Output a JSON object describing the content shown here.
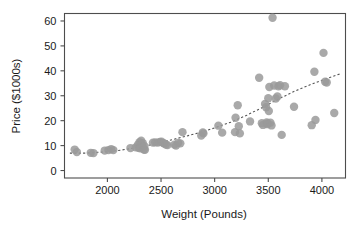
{
  "chart_data": {
    "type": "scatter",
    "title": "",
    "xlabel": "Weight (Pounds)",
    "ylabel": "Price ($1000s)",
    "xlim": [
      1600,
      4220
    ],
    "ylim": [
      -3,
      63
    ],
    "xticks": [
      2000,
      2500,
      3000,
      3500,
      4000
    ],
    "yticks": [
      0,
      10,
      20,
      30,
      40,
      50,
      60
    ],
    "xtick_labels": [
      "2000",
      "2500",
      "3000",
      "3500",
      "4000"
    ],
    "ytick_labels": [
      "0",
      "10",
      "20",
      "30",
      "40",
      "50",
      "60"
    ],
    "grid": false,
    "legend": false,
    "marker_color": "#9a9a9a",
    "marker_size": 4.2,
    "trend_style": "dashed",
    "trend_color": "#555555",
    "points": [
      [
        1695,
        8.4
      ],
      [
        1715,
        7.4
      ],
      [
        1845,
        7.1
      ],
      [
        1870,
        7.0
      ],
      [
        1975,
        8.0
      ],
      [
        2010,
        8.2
      ],
      [
        2035,
        8.6
      ],
      [
        2055,
        8.2
      ],
      [
        2215,
        9.0
      ],
      [
        2265,
        9.3
      ],
      [
        2285,
        10.4
      ],
      [
        2290,
        9.1
      ],
      [
        2300,
        11.4
      ],
      [
        2305,
        8.9
      ],
      [
        2315,
        12.0
      ],
      [
        2320,
        10.3
      ],
      [
        2325,
        9.4
      ],
      [
        2330,
        11.0
      ],
      [
        2340,
        8.4
      ],
      [
        2345,
        9.8
      ],
      [
        2350,
        8.3
      ],
      [
        2425,
        11.2
      ],
      [
        2445,
        11.3
      ],
      [
        2470,
        11.2
      ],
      [
        2490,
        11.5
      ],
      [
        2505,
        11.6
      ],
      [
        2520,
        11.0
      ],
      [
        2530,
        10.9
      ],
      [
        2545,
        10.4
      ],
      [
        2560,
        10.2
      ],
      [
        2625,
        10.4
      ],
      [
        2640,
        10.0
      ],
      [
        2660,
        11.1
      ],
      [
        2680,
        10.9
      ],
      [
        2700,
        15.4
      ],
      [
        2875,
        14.0
      ],
      [
        2890,
        15.3
      ],
      [
        2895,
        14.9
      ],
      [
        3035,
        18.0
      ],
      [
        3070,
        15.2
      ],
      [
        3190,
        15.4
      ],
      [
        3195,
        21.2
      ],
      [
        3215,
        26.2
      ],
      [
        3225,
        17.8
      ],
      [
        3235,
        14.9
      ],
      [
        3330,
        19.7
      ],
      [
        3415,
        37.2
      ],
      [
        3440,
        19.0
      ],
      [
        3450,
        18.3
      ],
      [
        3470,
        26.7
      ],
      [
        3480,
        25.4
      ],
      [
        3485,
        19.3
      ],
      [
        3490,
        18.6
      ],
      [
        3495,
        18.9
      ],
      [
        3500,
        29.0
      ],
      [
        3505,
        23.9
      ],
      [
        3510,
        33.5
      ],
      [
        3520,
        19.2
      ],
      [
        3530,
        18.1
      ],
      [
        3540,
        61.3
      ],
      [
        3555,
        34.1
      ],
      [
        3570,
        28.9
      ],
      [
        3585,
        29.7
      ],
      [
        3595,
        33.8
      ],
      [
        3610,
        34.2
      ],
      [
        3625,
        14.3
      ],
      [
        3655,
        33.8
      ],
      [
        3740,
        25.6
      ],
      [
        3905,
        18.2
      ],
      [
        3930,
        39.6
      ],
      [
        3940,
        20.3
      ],
      [
        4015,
        47.2
      ],
      [
        4030,
        35.6
      ],
      [
        4045,
        35.3
      ],
      [
        4115,
        23.1
      ]
    ],
    "trend_points": [
      [
        1650,
        7.0
      ],
      [
        1800,
        7.0
      ],
      [
        1950,
        7.4
      ],
      [
        2100,
        8.0
      ],
      [
        2250,
        9.0
      ],
      [
        2400,
        10.3
      ],
      [
        2550,
        11.8
      ],
      [
        2700,
        13.4
      ],
      [
        2850,
        15.1
      ],
      [
        3000,
        17.1
      ],
      [
        3150,
        19.4
      ],
      [
        3300,
        22.2
      ],
      [
        3450,
        25.4
      ],
      [
        3600,
        28.8
      ],
      [
        3750,
        31.9
      ],
      [
        3900,
        34.6
      ],
      [
        4050,
        37.0
      ],
      [
        4180,
        38.9
      ]
    ]
  }
}
